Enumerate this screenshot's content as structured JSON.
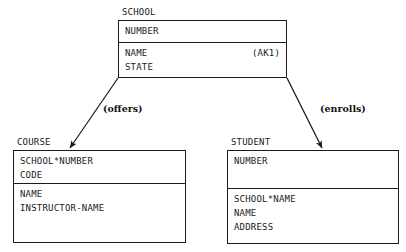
{
  "diagram": {
    "kind": "entity-relationship-diagram",
    "line_color": "#1a1a1a",
    "background": "#ffffff"
  },
  "entities": {
    "school": {
      "title": "SCHOOL",
      "key_attributes": [
        {
          "name": "NUMBER",
          "note": ""
        }
      ],
      "attributes": [
        {
          "name": "NAME",
          "note": "(AK1)"
        },
        {
          "name": "STATE",
          "note": ""
        }
      ]
    },
    "course": {
      "title": "COURSE",
      "key_attributes": [
        {
          "name": "SCHOOL*NUMBER",
          "note": ""
        },
        {
          "name": "CODE",
          "note": ""
        }
      ],
      "attributes": [
        {
          "name": "NAME",
          "note": ""
        },
        {
          "name": "INSTRUCTOR-NAME",
          "note": ""
        }
      ]
    },
    "student": {
      "title": "STUDENT",
      "key_attributes": [
        {
          "name": "NUMBER",
          "note": ""
        }
      ],
      "attributes": [
        {
          "name": "SCHOOL*NAME",
          "note": ""
        },
        {
          "name": "NAME",
          "note": ""
        },
        {
          "name": "ADDRESS",
          "note": ""
        }
      ]
    }
  },
  "relationships": {
    "offers": {
      "label": "(offers)",
      "from": "SCHOOL",
      "to": "COURSE"
    },
    "enrolls": {
      "label": "(enrolls)",
      "from": "SCHOOL",
      "to": "STUDENT"
    }
  }
}
